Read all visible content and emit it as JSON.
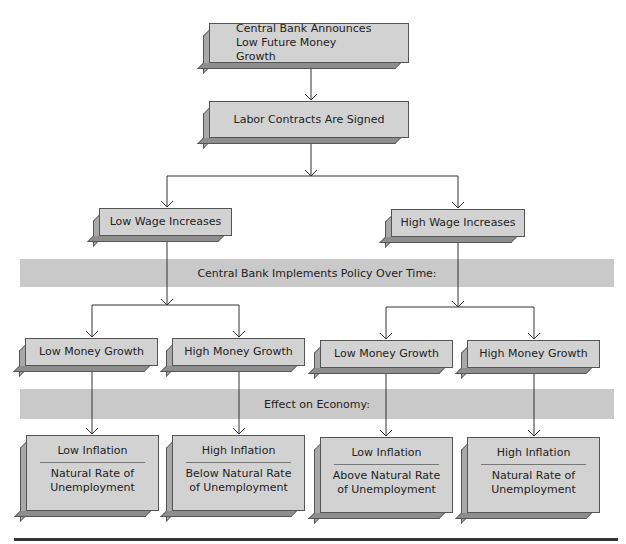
{
  "diagram": {
    "top": {
      "announcement": "Central Bank Announces Low Future Money Growth",
      "contracts": "Labor Contracts Are Signed"
    },
    "wages": {
      "low": "Low Wage Increases",
      "high": "High Wage Increases"
    },
    "bands": {
      "policy": "Central Bank Implements Policy Over Time:",
      "effect": "Effect on Economy:"
    },
    "money": [
      {
        "label": "Low Money Growth"
      },
      {
        "label": "High Money Growth"
      },
      {
        "label": "Low Money Growth"
      },
      {
        "label": "High Money Growth"
      }
    ],
    "outcomes": [
      {
        "inflation": "Low Inflation",
        "unemployment": "Natural Rate of Unemployment"
      },
      {
        "inflation": "High Inflation",
        "unemployment": "Below Natural Rate of Unemployment"
      },
      {
        "inflation": "Low Inflation",
        "unemployment": "Above Natural Rate of Unemployment"
      },
      {
        "inflation": "High Inflation",
        "unemployment": "Natural Rate of Unemployment"
      }
    ]
  }
}
